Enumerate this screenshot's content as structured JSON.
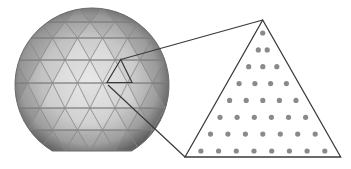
{
  "figure": {
    "colors": {
      "background": "#ffffff",
      "sphere_center": "#e6e6e6",
      "sphere_mid": "#cfcfcf",
      "sphere_edge": "#7a7a7a",
      "mesh_line": "#8c8c8c",
      "outline": "#3a3a3a",
      "dot": "#8a8a8a"
    },
    "sphere": {
      "center": [
        92,
        85
      ],
      "radius": 77,
      "bottom_cut_y": 151,
      "row_lines_y": [
        22,
        38,
        60,
        83,
        108,
        130
      ],
      "highlighted_facet": [
        [
          120.7,
          59.5
        ],
        [
          107,
          82.5
        ],
        [
          132,
          82.5
        ]
      ]
    },
    "connectors": [
      {
        "from": [
          120.7,
          59.5
        ],
        "to": [
          262.7,
          20
        ]
      },
      {
        "from": [
          108,
          85
        ],
        "to": [
          185,
          157
        ]
      }
    ],
    "magnified_triangle": {
      "vertices": [
        [
          262.7,
          20
        ],
        [
          185,
          157
        ],
        [
          340.7,
          157
        ]
      ],
      "rows": 8,
      "dots_per_row": [
        1,
        2,
        3,
        4,
        5,
        6,
        7,
        8
      ],
      "dot_radius": 2.6,
      "total_dots": 36
    }
  }
}
